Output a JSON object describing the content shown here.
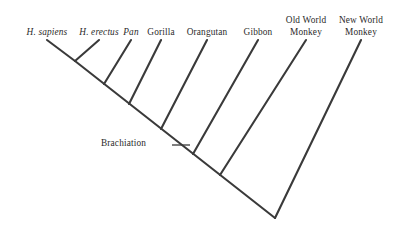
{
  "figure": {
    "type": "cladogram",
    "background_color": "#ffffff",
    "line_color": "#3a3a3a",
    "text_color": "#2b2b2b",
    "line_width": 2.1,
    "width": 397,
    "height": 231
  },
  "taxa": [
    {
      "id": "h-sapiens",
      "label": "H. sapiens",
      "label_line2": "",
      "italic": true,
      "label_x": 47,
      "label_y": 27,
      "tip_x": 47,
      "tip_y": 40
    },
    {
      "id": "h-erectus",
      "label": "H. erectus",
      "label_line2": "",
      "italic": true,
      "label_x": 99,
      "label_y": 27,
      "tip_x": 99,
      "tip_y": 40
    },
    {
      "id": "pan",
      "label": "Pan",
      "label_line2": "",
      "italic": true,
      "label_x": 131,
      "label_y": 27,
      "tip_x": 131,
      "tip_y": 40
    },
    {
      "id": "gorilla",
      "label": "Gorilla",
      "label_line2": "",
      "italic": false,
      "label_x": 161,
      "label_y": 27,
      "tip_x": 161,
      "tip_y": 40
    },
    {
      "id": "orangutan",
      "label": "Orangutan",
      "label_line2": "",
      "italic": false,
      "label_x": 207,
      "label_y": 27,
      "tip_x": 207,
      "tip_y": 40
    },
    {
      "id": "gibbon",
      "label": "Gibbon",
      "label_line2": "",
      "italic": false,
      "label_x": 258,
      "label_y": 27,
      "tip_x": 258,
      "tip_y": 40
    },
    {
      "id": "old-world-monkey",
      "label": "Old World",
      "label_line2": "Monkey",
      "italic": false,
      "label_x": 306,
      "label_y": 15,
      "tip_x": 306,
      "tip_y": 40
    },
    {
      "id": "new-world-monkey",
      "label": "New World",
      "label_line2": "Monkey",
      "italic": false,
      "label_x": 361,
      "label_y": 15,
      "tip_x": 361,
      "tip_y": 40
    }
  ],
  "nodes": [
    {
      "id": "node-homo",
      "x": 75,
      "y": 61
    },
    {
      "id": "node-hominini",
      "x": 104,
      "y": 84
    },
    {
      "id": "node-homininae",
      "x": 129,
      "y": 104
    },
    {
      "id": "node-hominidae",
      "x": 161,
      "y": 129
    },
    {
      "id": "node-hominoidea",
      "x": 193,
      "y": 154
    },
    {
      "id": "node-catarrhini",
      "x": 220,
      "y": 175
    },
    {
      "id": "node-root-tip",
      "x": 275,
      "y": 218
    }
  ],
  "branches": [
    {
      "id": "branch-h-sapiens",
      "x1": 47,
      "y1": 40,
      "x2": 75,
      "y2": 61
    },
    {
      "id": "branch-h-erectus",
      "x1": 99,
      "y1": 40,
      "x2": 75,
      "y2": 61
    },
    {
      "id": "branch-pan",
      "x1": 131,
      "y1": 40,
      "x2": 104,
      "y2": 84
    },
    {
      "id": "branch-gorilla",
      "x1": 161,
      "y1": 40,
      "x2": 129,
      "y2": 104
    },
    {
      "id": "branch-orangutan",
      "x1": 207,
      "y1": 40,
      "x2": 161,
      "y2": 129
    },
    {
      "id": "branch-gibbon",
      "x1": 258,
      "y1": 40,
      "x2": 193,
      "y2": 154
    },
    {
      "id": "branch-old-world-monkey",
      "x1": 306,
      "y1": 40,
      "x2": 220,
      "y2": 175
    },
    {
      "id": "branch-new-world-monkey",
      "x1": 361,
      "y1": 40,
      "x2": 275,
      "y2": 218
    },
    {
      "id": "branch-backbone",
      "x1": 75,
      "y1": 61,
      "x2": 275,
      "y2": 218
    }
  ],
  "annotation": {
    "label": "Brachiation",
    "label_x": 101,
    "label_y": 138,
    "pointer_x1": 172,
    "pointer_y1": 145,
    "pointer_x2": 190,
    "pointer_y2": 145
  }
}
